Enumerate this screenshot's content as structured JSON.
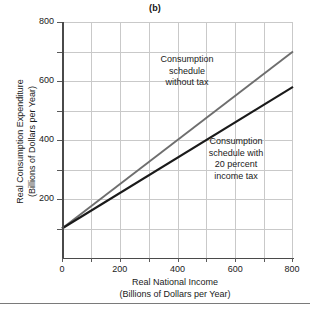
{
  "chart_data": {
    "type": "line",
    "title": "(b)",
    "xlabel": "Real National Income",
    "xlabel_sub": "(Billions of Dollars per Year)",
    "ylabel": "Real Consumption Expenditure",
    "ylabel_sub": "(Billions of Dollars per Year)",
    "xlim": [
      0,
      800
    ],
    "ylim": [
      0,
      800
    ],
    "grid": true,
    "grid_step": 100,
    "legend_position": "inline-annotations",
    "xticks": [
      0,
      200,
      400,
      600,
      800
    ],
    "xtick_labels": [
      "0",
      "200",
      "400",
      "600",
      "800"
    ],
    "yticks": [
      200,
      400,
      600,
      800
    ],
    "ytick_labels": [
      "200",
      "400",
      "600",
      "800"
    ],
    "series": [
      {
        "name": "Consumption schedule without tax",
        "color": "#6e6e6e",
        "intercept": 100,
        "slope": 0.75,
        "x": [
          0,
          800
        ],
        "values": [
          100,
          700
        ]
      },
      {
        "name": "Consumption schedule with 20 percent income tax",
        "color": "#1a1a1a",
        "intercept": 100,
        "slope": 0.6,
        "x": [
          0,
          800
        ],
        "values": [
          100,
          580
        ]
      }
    ],
    "annotations": [
      {
        "id": "no-tax",
        "lines": [
          "Consumption",
          "schedule",
          "without tax"
        ],
        "text": "Consumption schedule without tax"
      },
      {
        "id": "with-tax",
        "lines": [
          "Consumption",
          "schedule with",
          "20 percent",
          "income tax"
        ],
        "text": "Consumption schedule with 20 percent income tax"
      }
    ],
    "colors": {
      "grid": "#c9c9c9",
      "axis": "#4a4a4a",
      "background": "#ffffff",
      "text": "#1a1a1a"
    }
  }
}
